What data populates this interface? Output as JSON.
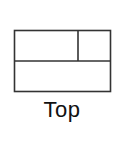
{
  "option": {
    "label": "Top",
    "layout": "top",
    "panes": [
      {
        "name": "top-left",
        "region": "top"
      },
      {
        "name": "top-right",
        "region": "top"
      },
      {
        "name": "bottom",
        "region": "bottom"
      }
    ]
  },
  "colors": {
    "stroke": "#333333",
    "text": "#111111",
    "background": "#ffffff"
  }
}
